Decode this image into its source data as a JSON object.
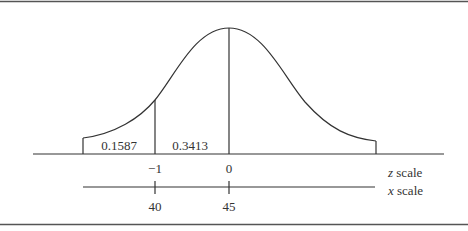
{
  "figure": {
    "type": "normal-distribution-diagram",
    "areas": [
      {
        "label": "0.1587",
        "region": "left tail, z < -1"
      },
      {
        "label": "0.3413",
        "region": "-1 < z < 0"
      }
    ],
    "z_scale": {
      "label_italic": "z",
      "label_rest": " scale",
      "ticks": [
        "−1",
        "0"
      ]
    },
    "x_scale": {
      "label_italic": "x",
      "label_rest": " scale",
      "ticks": [
        "40",
        "45"
      ]
    }
  },
  "colors": {
    "line": "#333333",
    "border": "#555555",
    "background": "#ffffff"
  }
}
